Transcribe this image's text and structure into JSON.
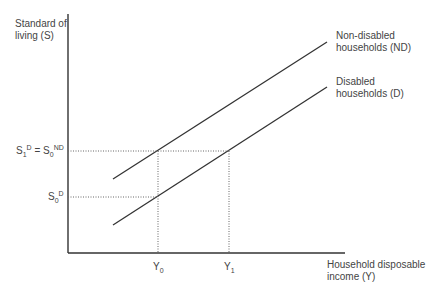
{
  "diagram": {
    "y_axis_label_line1": "Standard of",
    "y_axis_label_line2": "living (S)",
    "x_axis_label_line1": "Household disposable",
    "x_axis_label_line2": "income (Y)",
    "nd_label_line1": "Non-disabled",
    "nd_label_line2": "households (ND)",
    "d_label_line1": "Disabled",
    "d_label_line2": "households (D)",
    "s1_base": "S",
    "s1_sub": "1",
    "s1_sup": "D",
    "equals": " = ",
    "s0nd_base": "S",
    "s0nd_sub": "0",
    "s0nd_sup": "ND",
    "s0d_base": "S",
    "s0d_sub": "0",
    "s0d_sup": "D",
    "y0_base": "Y",
    "y0_sub": "0",
    "y1_base": "Y",
    "y1_sub": "1"
  },
  "colors": {
    "axis": "#333333",
    "line": "#333333",
    "dotted": "#555555",
    "text": "#444444"
  }
}
